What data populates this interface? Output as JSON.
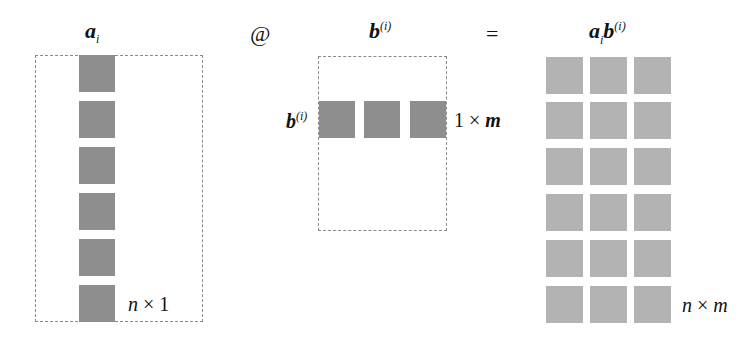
{
  "labels": {
    "a_i_main": "a",
    "a_i_sub": "i",
    "at_symbol": "@",
    "b_i_main": "b",
    "b_i_sup": "(i)",
    "equals": "=",
    "result_a": "a",
    "result_a_sub": "i",
    "result_b": "b",
    "result_b_sup": "(i)",
    "row_label_main": "b",
    "row_label_sup": "(i)"
  },
  "dimensions": {
    "left_n": "n",
    "left_x": "×",
    "left_1": "1",
    "mid_1": "1",
    "mid_x": "×",
    "mid_m": "m",
    "right_n": "n",
    "right_x": "×",
    "right_m": "m"
  },
  "colors": {
    "operand_square": "#8e8e8e",
    "result_square": "#b3b3b3",
    "dashed_border": "#8a8a8a"
  },
  "matrices": {
    "a_i": {
      "rows": 6,
      "cols": 1
    },
    "b_i": {
      "rows": 1,
      "cols": 3
    },
    "result": {
      "rows": 6,
      "cols": 3
    }
  }
}
